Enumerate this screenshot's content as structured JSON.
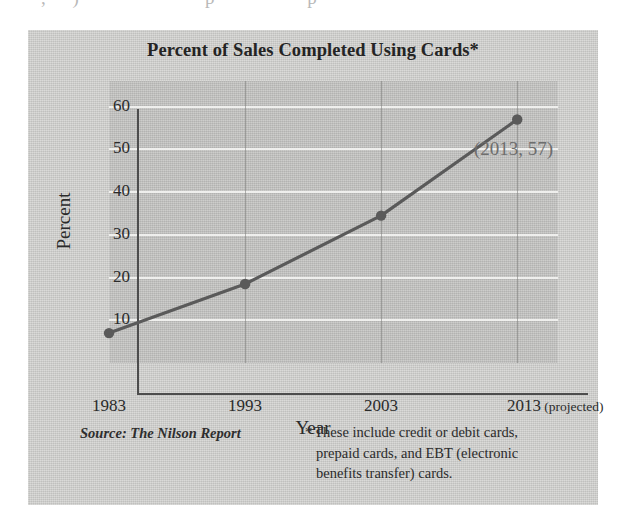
{
  "page": {
    "background_color": "#ffffff",
    "panel_color": "#cdcdcb",
    "plot_color": "#c2c2c0",
    "series_color": "#5a5a5a",
    "gridline_color": "#efefed",
    "axis_color": "#4d4d4d",
    "annotation_color": "#6e6e6e",
    "bleed_text": "· , )       ·    ·  ·    p    ·  ·  p   ·  ·"
  },
  "chart_data": {
    "type": "line",
    "title": "Percent of Sales Completed Using Cards*",
    "xlabel": "Year",
    "ylabel": "Percent",
    "x": [
      1983,
      1993,
      2003,
      2013
    ],
    "categories": [
      "1983",
      "1993",
      "2003",
      "2013 (projected)"
    ],
    "values": [
      7,
      18.5,
      34.5,
      57
    ],
    "xlim": [
      1983,
      2016
    ],
    "ylim": [
      0,
      66
    ],
    "yticks": [
      10,
      20,
      30,
      40,
      50,
      60
    ],
    "ytick_labels": [
      "10",
      "20",
      "30",
      "40",
      "50",
      "60"
    ],
    "xticks": [
      1983,
      1993,
      2003,
      2013
    ],
    "xtick_labels": [
      "1983",
      "1993",
      "2003",
      "2013"
    ],
    "xtick_suffixes": [
      "",
      "",
      "",
      " (projected)"
    ],
    "grid": "horizontal-white-plus-faint-vertical",
    "legend": "none",
    "markers": "filled-circle",
    "annotations": [
      {
        "label": "(2013, 57)",
        "x": 2013,
        "y": 57
      }
    ]
  },
  "annotation": {
    "point_label": "(2013, 57)"
  },
  "source": {
    "text": "Source: The Nilson Report"
  },
  "footnote": {
    "star": "*",
    "line1": "These include credit or debit cards,",
    "line2": "prepaid cards, and EBT (electronic",
    "line3": "benefits transfer) cards."
  },
  "axis": {
    "x_title": "Year",
    "y_title": "Percent"
  }
}
